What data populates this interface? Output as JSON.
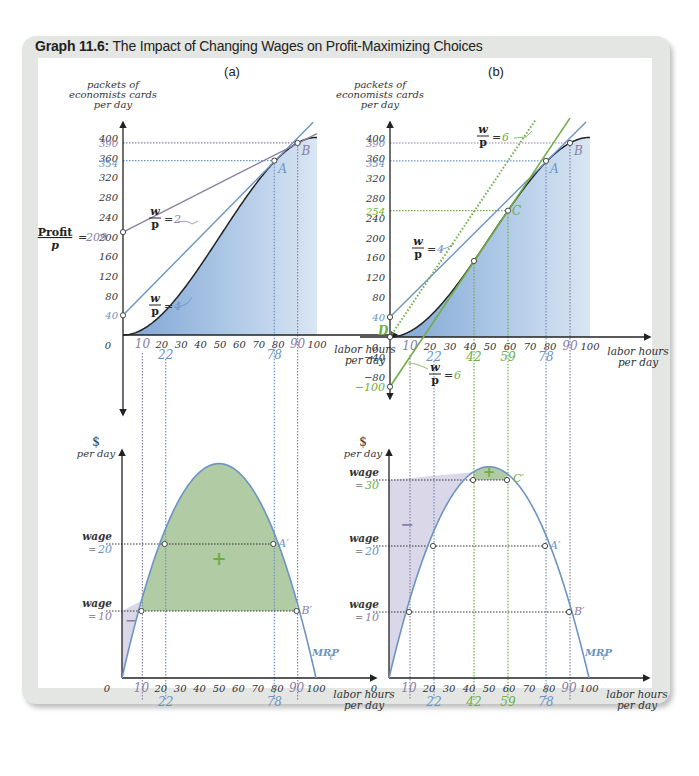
{
  "figure": {
    "label": "Graph 11.6:",
    "title": "The Impact of Changing Wages on Profit-Maximizing Choices"
  },
  "colors": {
    "blue": "#6b94c4",
    "purple": "#8a7fa6",
    "green": "#6fae45",
    "fill_blue": "#a9c4e3",
    "fill_green": "#a9c79a",
    "fill_purple": "#d6d3e6"
  },
  "panels": {
    "a": {
      "label": "(a)",
      "top": {
        "ylabel": [
          "packets of",
          "economists cards",
          "per day"
        ],
        "xlabel": [
          "labor hours",
          "per day"
        ],
        "origin": "0",
        "profit_label": "Profit",
        "profit_den": "p",
        "profit_value": "209",
        "wp2_label": "= 2",
        "wp4_label": "= 4",
        "intercept_40": "40",
        "point_A": "A",
        "point_B": "B",
        "y390": "390",
        "y354": "354"
      },
      "bottom": {
        "ylabel": [
          "$",
          "per day"
        ],
        "xlabel": [
          "labor hours",
          "per day"
        ],
        "origin": "0",
        "wage_word": "wage",
        "wage20": "= 20",
        "wage10": "= 10",
        "point_A": "A′",
        "point_B": "B′",
        "plus": "+",
        "minus": "−",
        "curve": "MRP"
      }
    },
    "b": {
      "label": "(b)",
      "top": {
        "ylabel": [
          "packets of",
          "economists cards",
          "per day"
        ],
        "xlabel": [
          "labor hours",
          "per day"
        ],
        "origin": "0",
        "wp6_label": "= 6",
        "wp4_label": "= 4",
        "wp6b_label": "= 6",
        "intercept_40": "40",
        "intercept_neg100": "−100",
        "point_A": "A",
        "point_B": "B",
        "point_C": "C",
        "point_D": "D",
        "y390": "390",
        "y354": "354",
        "y254": "254"
      },
      "bottom": {
        "ylabel": [
          "$",
          "per day"
        ],
        "xlabel": [
          "labor hours",
          "per day"
        ],
        "origin": "0",
        "wage_word": "wage",
        "wage30": "= 30",
        "wage20": "= 20",
        "wage10": "= 10",
        "point_A": "A′",
        "point_B": "B′",
        "point_C": "C′",
        "plus": "+",
        "minus": "−",
        "curve": "MRP"
      }
    }
  },
  "chart_data": [
    {
      "type": "line",
      "title": "(a) Production function with isoprofit lines",
      "xlabel": "labor hours per day",
      "ylabel": "packets of economists cards per day",
      "xlim": [
        0,
        100
      ],
      "ylim": [
        0,
        400
      ],
      "x_ticks": [
        0,
        10,
        20,
        30,
        40,
        50,
        60,
        70,
        80,
        90,
        100
      ],
      "y_ticks": [
        0,
        40,
        80,
        120,
        160,
        200,
        240,
        280,
        320,
        360,
        400
      ],
      "highlighted_x": [
        10,
        22,
        78,
        90
      ],
      "highlighted_y": [
        40,
        209,
        354,
        390
      ],
      "series": [
        {
          "name": "production function",
          "x": [
            0,
            10,
            20,
            30,
            40,
            50,
            60,
            70,
            78,
            90,
            100
          ],
          "y": [
            0,
            12,
            45,
            87,
            134,
            201,
            260,
            316,
            354,
            390,
            401
          ]
        },
        {
          "name": "w/p = 2 isoprofit",
          "intercept": 209,
          "slope": 2
        },
        {
          "name": "w/p = 4 isoprofit",
          "intercept": 40,
          "slope": 4
        }
      ],
      "annotations": [
        {
          "label": "A",
          "x": 78,
          "y": 354
        },
        {
          "label": "B",
          "x": 90,
          "y": 390
        },
        {
          "label": "Profit/p = 209"
        }
      ]
    },
    {
      "type": "line",
      "title": "(b) Production function with isoprofit lines",
      "xlabel": "labor hours per day",
      "ylabel": "packets of economists cards per day",
      "xlim": [
        0,
        100
      ],
      "ylim": [
        -100,
        400
      ],
      "x_ticks": [
        0,
        10,
        20,
        30,
        40,
        50,
        60,
        70,
        80,
        90,
        100
      ],
      "y_ticks": [
        -80,
        -40,
        0,
        40,
        80,
        120,
        160,
        200,
        240,
        280,
        320,
        360,
        400
      ],
      "highlighted_x": [
        10,
        22,
        42,
        59,
        78,
        90
      ],
      "highlighted_y": [
        -100,
        40,
        254,
        354,
        390
      ],
      "series": [
        {
          "name": "production function",
          "x": [
            0,
            10,
            20,
            30,
            40,
            50,
            59,
            70,
            78,
            90,
            100
          ],
          "y": [
            0,
            12,
            45,
            87,
            134,
            201,
            254,
            316,
            354,
            390,
            401
          ]
        },
        {
          "name": "w/p = 6 (dotted, through origin D)",
          "intercept": 0,
          "slope": 6
        },
        {
          "name": "w/p = 6 isoprofit (tangent at C)",
          "intercept": -100,
          "slope": 6
        },
        {
          "name": "w/p = 4 isoprofit",
          "intercept": 40,
          "slope": 4
        }
      ],
      "annotations": [
        {
          "label": "A",
          "x": 78,
          "y": 354
        },
        {
          "label": "B",
          "x": 90,
          "y": 390
        },
        {
          "label": "C",
          "x": 59,
          "y": 254
        },
        {
          "label": "D",
          "x": 0,
          "y": 0
        }
      ]
    },
    {
      "type": "area",
      "title": "(a) Marginal revenue product of labor",
      "xlabel": "labor hours per day",
      "ylabel": "$ per day",
      "xlim": [
        0,
        100
      ],
      "x_ticks": [
        0,
        10,
        20,
        30,
        40,
        50,
        60,
        70,
        80,
        90,
        100
      ],
      "highlighted_x": [
        10,
        22,
        78,
        90
      ],
      "series": [
        {
          "name": "MRP_l",
          "x": [
            0,
            10,
            22,
            50,
            78,
            90,
            100
          ],
          "y": [
            0,
            10,
            20,
            32,
            20,
            10,
            0
          ]
        }
      ],
      "wages": [
        20,
        10
      ],
      "annotations": [
        {
          "label": "A′",
          "x": 78,
          "y": 20
        },
        {
          "label": "B′",
          "x": 90,
          "y": 10
        },
        {
          "label": "+",
          "region": "between MRP and wage 10 from 10 to 90"
        },
        {
          "label": "−",
          "region": "between wage 10 and MRP from 0 to 10"
        }
      ]
    },
    {
      "type": "area",
      "title": "(b) Marginal revenue product of labor",
      "xlabel": "labor hours per day",
      "ylabel": "$ per day",
      "xlim": [
        0,
        100
      ],
      "x_ticks": [
        0,
        10,
        20,
        30,
        40,
        50,
        60,
        70,
        80,
        90,
        100
      ],
      "highlighted_x": [
        10,
        22,
        42,
        59,
        78,
        90
      ],
      "series": [
        {
          "name": "MRP_l",
          "x": [
            0,
            10,
            22,
            42,
            50,
            59,
            78,
            90,
            100
          ],
          "y": [
            0,
            10,
            20,
            30,
            32,
            30,
            20,
            10,
            0
          ]
        }
      ],
      "wages": [
        30,
        20,
        10
      ],
      "annotations": [
        {
          "label": "C′",
          "x": 59,
          "y": 30
        },
        {
          "label": "A′",
          "x": 78,
          "y": 20
        },
        {
          "label": "B′",
          "x": 90,
          "y": 10
        },
        {
          "label": "+",
          "region": "between MRP and wage 30 from 42 to 59"
        },
        {
          "label": "−",
          "region": "between wage 30 and MRP from 0 to 42"
        }
      ]
    }
  ]
}
